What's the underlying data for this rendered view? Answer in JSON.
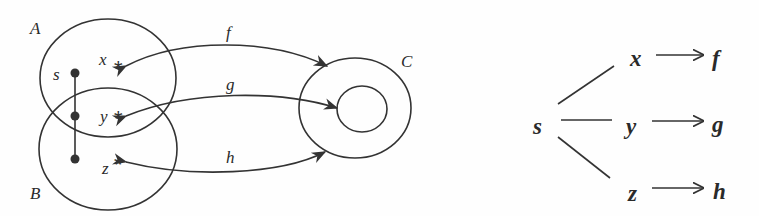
{
  "left_diagram": {
    "sets": [
      {
        "label": "A"
      },
      {
        "label": "B"
      },
      {
        "label": "C"
      }
    ],
    "point_labels": {
      "s": "s",
      "x": "x",
      "y": "y",
      "z": "z"
    },
    "star_glyph": "*",
    "maps": [
      {
        "label": "f",
        "from": "x"
      },
      {
        "label": "g",
        "from": "y"
      },
      {
        "label": "h",
        "from": "z"
      }
    ]
  },
  "right_diagram": {
    "root": "s",
    "branches": [
      {
        "node": "x",
        "target": "f"
      },
      {
        "node": "y",
        "target": "g"
      },
      {
        "node": "z",
        "target": "h"
      }
    ]
  },
  "colors": {
    "ink": "#333333",
    "background": "#fefefe"
  }
}
